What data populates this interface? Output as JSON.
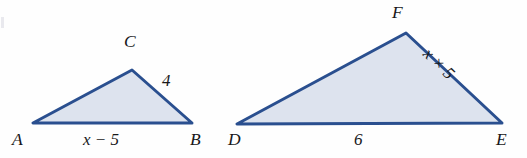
{
  "figure": {
    "background_color": "#fefefe",
    "stroke_color": "#2a4f8f",
    "fill_color": "#dde3ee",
    "label_color": "#18181a"
  },
  "triangles": [
    {
      "name": "triangle-abc",
      "vertices": [
        {
          "name": "A",
          "label": "A",
          "x": 33,
          "y": 123
        },
        {
          "name": "B",
          "label": "B",
          "x": 192,
          "y": 123
        },
        {
          "name": "C",
          "label": "C",
          "x": 132,
          "y": 70
        }
      ],
      "side_labels": [
        {
          "name": "side-ab",
          "label": "x − 5",
          "x": 83,
          "y": 132,
          "rotation": 0
        },
        {
          "name": "side-cb",
          "label": "4",
          "x": 162,
          "y": 73,
          "rotation": 0
        }
      ],
      "vertex_labels": [
        {
          "name": "vertex-label-a",
          "label": "A",
          "x": 12,
          "y": 131
        },
        {
          "name": "vertex-label-b",
          "label": "B",
          "x": 190,
          "y": 131
        },
        {
          "name": "vertex-label-c",
          "label": "C",
          "x": 124,
          "y": 33
        }
      ]
    },
    {
      "name": "triangle-def",
      "vertices": [
        {
          "name": "D",
          "label": "D",
          "x": 237,
          "y": 124
        },
        {
          "name": "E",
          "label": "E",
          "x": 502,
          "y": 123
        },
        {
          "name": "F",
          "label": "F",
          "x": 406,
          "y": 33
        }
      ],
      "side_labels": [
        {
          "name": "side-de",
          "label": "6",
          "x": 355,
          "y": 132,
          "rotation": 0
        },
        {
          "name": "side-fe",
          "label": "x × 5",
          "x": 432,
          "y": 47,
          "rotation": 44
        }
      ],
      "vertex_labels": [
        {
          "name": "vertex-label-d",
          "label": "D",
          "x": 228,
          "y": 131
        },
        {
          "name": "vertex-label-e",
          "label": "E",
          "x": 497,
          "y": 131
        },
        {
          "name": "vertex-label-f",
          "label": "F",
          "x": 392,
          "y": 3
        }
      ]
    }
  ]
}
